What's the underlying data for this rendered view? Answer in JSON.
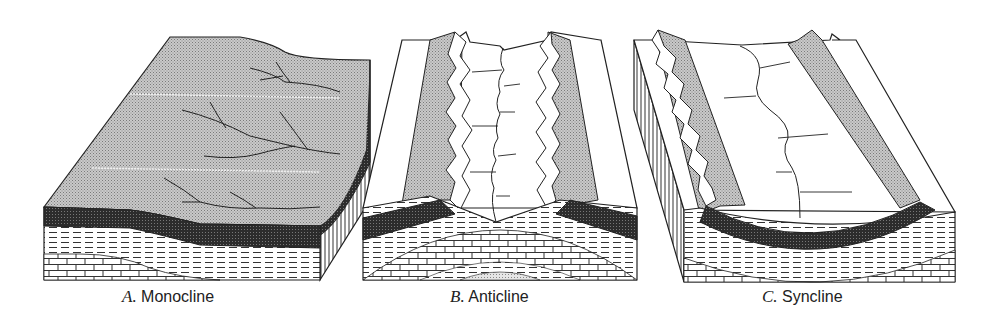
{
  "figure": {
    "panels": [
      {
        "id": "A",
        "letter": "A.",
        "title": "Monocline"
      },
      {
        "id": "B",
        "letter": "B.",
        "title": "Anticline"
      },
      {
        "id": "C",
        "letter": "C.",
        "title": "Syncline"
      }
    ],
    "colors": {
      "outline": "#222222",
      "stipple_surface": "#b8b8b8",
      "dark_layer": "#333333",
      "background": "#ffffff"
    }
  }
}
